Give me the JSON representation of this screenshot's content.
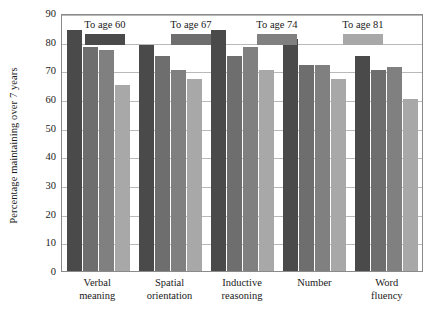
{
  "chart_data": {
    "type": "bar",
    "title": "",
    "xlabel": "",
    "ylabel": "Percentage maintaining over 7 years",
    "ylim": [
      0,
      90
    ],
    "ytick_step": 10,
    "yticks": [
      "90",
      "80",
      "70",
      "60",
      "50",
      "40",
      "30",
      "20",
      "10",
      "0"
    ],
    "grid": true,
    "legend_position": "top-left-inside",
    "categories": [
      "Verbal meaning",
      "Spatial orientation",
      "Inductive reasoning",
      "Number",
      "Word fluency"
    ],
    "categories_lines": [
      [
        "Verbal",
        "meaning"
      ],
      [
        "Spatial",
        "orientation"
      ],
      [
        "Inductive",
        "reasoning"
      ],
      [
        "Number",
        ""
      ],
      [
        "Word",
        "fluency"
      ]
    ],
    "series": [
      {
        "name": "To age 60",
        "color": "#4a4a4a",
        "values": [
          84,
          79,
          84,
          81,
          75
        ]
      },
      {
        "name": "To age 67",
        "color": "#6e6e6e",
        "values": [
          78,
          75,
          75,
          72,
          70
        ]
      },
      {
        "name": "To age 74",
        "color": "#808080",
        "values": [
          77,
          70,
          78,
          72,
          71
        ]
      },
      {
        "name": "To age 81",
        "color": "#a8a8a8",
        "values": [
          65,
          67,
          70,
          67,
          60
        ]
      }
    ]
  },
  "colors": {
    "frame": "#8a8a8a",
    "gridline": "#b9b9b9",
    "text": "#1a1a1a",
    "background": "#ffffff"
  }
}
